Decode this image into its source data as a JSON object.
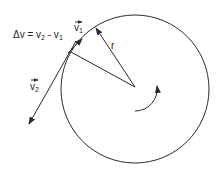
{
  "diagram": {
    "type": "circular-motion-velocity-diagram",
    "equation": {
      "prefix": "Δv = v",
      "sub1": "2",
      "middle": " - v",
      "sub2": "1"
    },
    "labels": {
      "v1": {
        "symbol": "v",
        "subscript": "1",
        "vector_arrow": true
      },
      "v2": {
        "symbol": "v",
        "subscript": "2",
        "vector_arrow": true
      },
      "radius": "r"
    },
    "elements": {
      "circle": {
        "cx": 135,
        "cy": 89,
        "r": 74
      },
      "radius_to_v1_point": {
        "from": [
          135,
          87
        ],
        "to": [
          96,
          28
        ],
        "arrowhead": "at-circle"
      },
      "radius_to_v2_point": {
        "from": [
          135,
          87
        ],
        "to": [
          71,
          52
        ]
      },
      "v1_vector": {
        "from": [
          69,
          52
        ],
        "to": [
          81,
          40
        ]
      },
      "v2_vector": {
        "from": [
          76,
          41
        ],
        "to": [
          29,
          124
        ]
      },
      "rotation_arrow": {
        "direction": "counterclockwise"
      }
    },
    "colors": {
      "stroke": "#2a2a2a",
      "text": "#222222",
      "background": "#ffffff"
    }
  }
}
